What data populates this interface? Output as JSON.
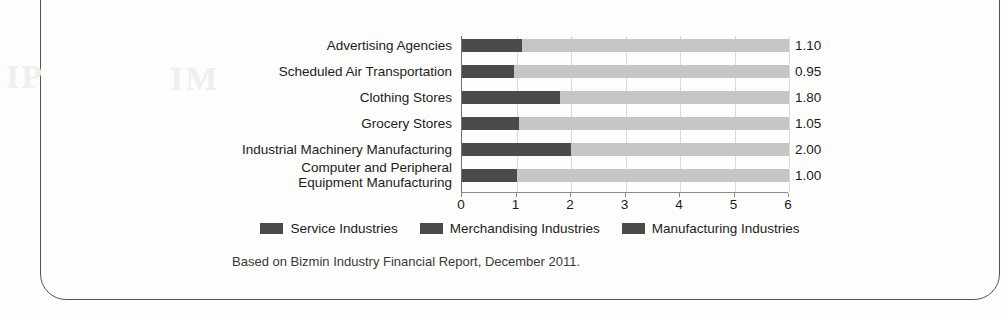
{
  "frame": {
    "border_color": "#545456"
  },
  "chart_data": {
    "type": "bar",
    "orientation": "horizontal",
    "title": "",
    "xlabel": "",
    "ylabel": "",
    "xlim": [
      0,
      6
    ],
    "xticks": [
      "0",
      "1",
      "2",
      "3",
      "4",
      "5",
      "6"
    ],
    "grid": true,
    "legend_position": "bottom",
    "track_max": 6,
    "categories": [
      "Advertising Agencies",
      "Scheduled Air Transportation",
      "Clothing Stores",
      "Grocery Stores",
      "Industrial Machinery Manufacturing",
      "Computer and Peripheral Equipment Manufacturing"
    ],
    "category_lines": [
      [
        "Advertising Agencies"
      ],
      [
        "Scheduled Air Transportation"
      ],
      [
        "Clothing Stores"
      ],
      [
        "Grocery Stores"
      ],
      [
        "Industrial Machinery Manufacturing"
      ],
      [
        "Computer and Peripheral",
        "Equipment Manufacturing"
      ]
    ],
    "values": [
      1.1,
      0.95,
      1.8,
      1.05,
      2.0,
      1.0
    ],
    "value_labels": [
      "1.10",
      "0.95",
      "1.80",
      "1.05",
      "2.00",
      "1.00"
    ],
    "group_of_category": [
      "Service Industries",
      "Service Industries",
      "Merchandising Industries",
      "Merchandising Industries",
      "Manufacturing Industries",
      "Manufacturing Industries"
    ],
    "legend": [
      {
        "label": "Service Industries",
        "color": "#4b4b4b"
      },
      {
        "label": "Merchandising Industries",
        "color": "#4b4b4b"
      },
      {
        "label": "Manufacturing Industries",
        "color": "#4b4b4b"
      }
    ],
    "colors": {
      "bar_fill": "#4b4b4b",
      "bar_track": "#c6c6c6",
      "gridline": "#d9d9d9",
      "axis": "#6d6d6d",
      "text": "#1c1c1c"
    }
  },
  "source_note": "Based on Bizmin Industry Financial Report, December 2011.",
  "artifacts": {
    "smudge_left": "IP",
    "smudge_mid": "IM"
  }
}
